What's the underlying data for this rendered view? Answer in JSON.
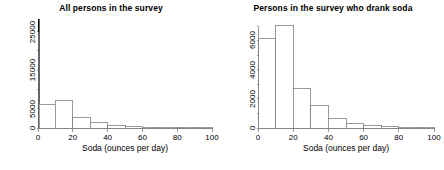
{
  "figure": {
    "width": 444,
    "height": 170,
    "background": "#ffffff",
    "foreground": "#000000",
    "axis_color": "#808080",
    "bar_outline_color": "#808080",
    "bar_fill_color": "#ffffff",
    "highlight_bar_color": "#000000"
  },
  "panels": [
    {
      "id": "all-persons",
      "title": "All persons in the survey",
      "xlabel": "Soda (ounces per day)",
      "ylabel": "",
      "xticks": [
        0,
        20,
        40,
        60,
        80,
        100
      ],
      "xtick_labels": [
        "0",
        "20",
        "40",
        "60",
        "80",
        "100"
      ],
      "yticks": [
        0,
        5000,
        10000,
        15000,
        20000,
        25000
      ],
      "ytick_labels": [
        "0",
        "5000",
        "",
        "15000",
        "",
        "25000"
      ],
      "xlim": [
        0,
        100
      ],
      "ylim": [
        0,
        28500
      ]
    },
    {
      "id": "drank-soda",
      "title": "Persons in the survey who drank soda",
      "xlabel": "Soda (ounces per day)",
      "ylabel": "",
      "xticks": [
        0,
        20,
        40,
        60,
        80,
        100
      ],
      "xtick_labels": [
        "0",
        "20",
        "40",
        "60",
        "80",
        "100"
      ],
      "yticks": [
        0,
        1000,
        2000,
        3000,
        4000,
        5000,
        6000,
        7000
      ],
      "ytick_labels": [
        "0",
        "",
        "2000",
        "",
        "4000",
        "",
        "6000",
        ""
      ],
      "xlim": [
        0,
        100
      ],
      "ylim": [
        0,
        7400
      ]
    }
  ],
  "chart_data": [
    {
      "type": "bar",
      "id": "all-persons",
      "title": "All persons in the survey",
      "xlabel": "Soda (ounces per day)",
      "ylabel": "",
      "xlim": [
        0,
        100
      ],
      "ylim": [
        0,
        28500
      ],
      "grid": false,
      "legend": null,
      "bin_width": 10,
      "categories": [
        "0",
        "0-10",
        "10-20",
        "20-30",
        "30-40",
        "40-50",
        "50-60",
        "60-70",
        "70-80",
        "80-90",
        "90-100"
      ],
      "bin_edges": [
        0,
        0.6,
        10,
        20,
        30,
        40,
        50,
        60,
        70,
        80,
        90,
        100
      ],
      "values": [
        28200,
        6100,
        7050,
        2700,
        1550,
        620,
        330,
        170,
        70,
        40,
        20
      ],
      "bar_styles": [
        "filled-black",
        "outline",
        "outline",
        "outline",
        "outline",
        "outline",
        "outline",
        "outline",
        "outline",
        "outline",
        "outline"
      ],
      "notes": "A very tall narrow black bar at zero ounces represents non-drinkers; the remaining bars are the same distribution shown in the right panel."
    },
    {
      "type": "bar",
      "id": "drank-soda",
      "title": "Persons in the survey who drank soda",
      "xlabel": "Soda (ounces per day)",
      "ylabel": "",
      "xlim": [
        0,
        100
      ],
      "ylim": [
        0,
        7400
      ],
      "grid": false,
      "legend": null,
      "bin_width": 10,
      "categories": [
        "0-10",
        "10-20",
        "20-30",
        "30-40",
        "40-50",
        "50-60",
        "60-70",
        "70-80",
        "80-90",
        "90-100"
      ],
      "bin_edges": [
        0,
        10,
        20,
        30,
        40,
        50,
        60,
        70,
        80,
        90,
        100
      ],
      "values": [
        6100,
        7050,
        2700,
        1550,
        620,
        330,
        170,
        70,
        40,
        20
      ],
      "bar_styles": [
        "outline",
        "outline",
        "outline",
        "outline",
        "outline",
        "outline",
        "outline",
        "outline",
        "outline",
        "outline"
      ]
    }
  ]
}
